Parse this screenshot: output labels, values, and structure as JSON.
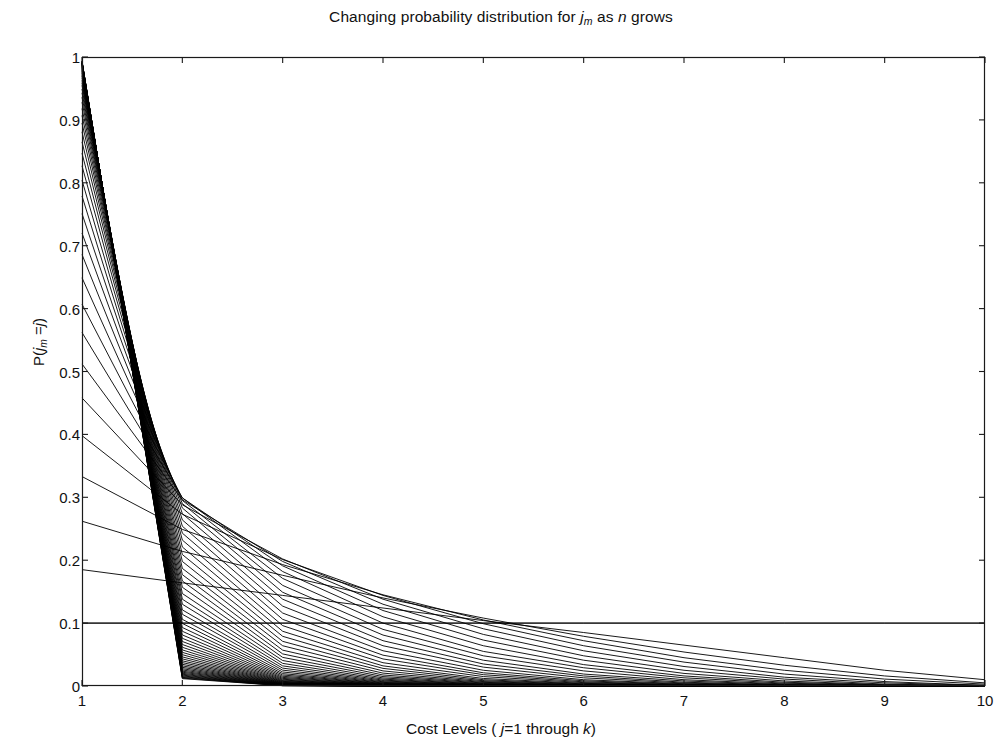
{
  "chart_data": {
    "type": "line",
    "title_parts": {
      "pre": "Changing probability distribution for ",
      "var1": "j",
      "var1_sub": "m",
      "mid": " as ",
      "var2": "n",
      "post": " grows"
    },
    "xlabel": "Cost Levels ( j=1 through  k)",
    "xlabel_parts": {
      "pre": "Cost Levels ( ",
      "var1": "j",
      "mid": "=1 through  ",
      "var2": "k",
      "post": ")"
    },
    "ylabel": "P(j_m =j)",
    "ylabel_parts": {
      "pre": "P(",
      "var1": "j",
      "var1_sub": "m",
      "mid": " =",
      "var2": "j",
      "post": ")"
    },
    "xlim": [
      1,
      10
    ],
    "ylim": [
      0,
      1
    ],
    "xticks": [
      "1",
      "2",
      "3",
      "4",
      "5",
      "6",
      "7",
      "8",
      "9",
      "10"
    ],
    "xtick_values": [
      1,
      2,
      3,
      4,
      5,
      6,
      7,
      8,
      9,
      10
    ],
    "yticks": [
      "0",
      "0.1",
      "0.2",
      "0.3",
      "0.4",
      "0.5",
      "0.6",
      "0.7",
      "0.8",
      "0.9",
      "1"
    ],
    "ytick_values": [
      0,
      0.1,
      0.2,
      0.3,
      0.4,
      0.5,
      0.6,
      0.7,
      0.8,
      0.9,
      1
    ],
    "grid": false,
    "legend": "none",
    "line_color": "#000000",
    "line_width": 0.9,
    "background_color": "#ffffff",
    "axis_color": "#1a1a1a",
    "x": [
      1,
      2,
      3,
      4,
      5,
      6,
      7,
      8,
      9,
      10
    ],
    "reference_lines": [
      {
        "orientation": "horizontal",
        "value": 0.1
      }
    ],
    "series": [
      {
        "name": "n=1",
        "values": [
          0.1,
          0.1,
          0.1,
          0.1,
          0.1,
          0.1,
          0.1,
          0.1,
          0.1,
          0.1
        ]
      },
      {
        "name": "n=2",
        "values": [
          0.185,
          0.164,
          0.144,
          0.124,
          0.104,
          0.085,
          0.065,
          0.045,
          0.025,
          0.01
        ]
      },
      {
        "name": "n=3",
        "values": [
          0.262,
          0.214,
          0.176,
          0.14,
          0.108,
          0.079,
          0.054,
          0.033,
          0.016,
          0.005
        ]
      },
      {
        "name": "n=4",
        "values": [
          0.333,
          0.249,
          0.193,
          0.145,
          0.105,
          0.072,
          0.045,
          0.025,
          0.011,
          0.003
        ]
      },
      {
        "name": "n=5",
        "values": [
          0.398,
          0.273,
          0.201,
          0.144,
          0.099,
          0.064,
          0.038,
          0.019,
          0.007,
          0.001
        ]
      },
      {
        "name": "n=6",
        "values": [
          0.458,
          0.288,
          0.202,
          0.138,
          0.091,
          0.056,
          0.031,
          0.014,
          0.005,
          0.001
        ]
      },
      {
        "name": "n=7",
        "values": [
          0.512,
          0.296,
          0.198,
          0.13,
          0.082,
          0.048,
          0.025,
          0.011,
          0.003,
          0.0005
        ]
      },
      {
        "name": "n=8",
        "values": [
          0.562,
          0.299,
          0.191,
          0.12,
          0.073,
          0.041,
          0.02,
          0.008,
          0.002,
          0.0003
        ]
      },
      {
        "name": "n=9",
        "values": [
          0.607,
          0.299,
          0.182,
          0.11,
          0.064,
          0.034,
          0.016,
          0.006,
          0.0015,
          0.0002
        ]
      },
      {
        "name": "n=10",
        "values": [
          0.649,
          0.295,
          0.171,
          0.1,
          0.055,
          0.029,
          0.013,
          0.0045,
          0.001,
          0.0001
        ]
      },
      {
        "name": "n=11",
        "values": [
          0.686,
          0.29,
          0.16,
          0.09,
          0.048,
          0.024,
          0.01,
          0.0033,
          0.0007,
          0.0001
        ]
      },
      {
        "name": "n=12",
        "values": [
          0.72,
          0.283,
          0.149,
          0.081,
          0.041,
          0.019,
          0.008,
          0.0024,
          0.0005,
          0.0001
        ]
      },
      {
        "name": "n=13",
        "values": [
          0.751,
          0.274,
          0.138,
          0.072,
          0.035,
          0.016,
          0.006,
          0.0018,
          0.0003,
          0.0
        ]
      },
      {
        "name": "n=14",
        "values": [
          0.779,
          0.264,
          0.127,
          0.064,
          0.03,
          0.013,
          0.0047,
          0.0013,
          0.0002,
          0.0
        ]
      },
      {
        "name": "n=15",
        "values": [
          0.804,
          0.254,
          0.116,
          0.056,
          0.025,
          0.01,
          0.0036,
          0.001,
          0.0002,
          0.0
        ]
      },
      {
        "name": "n=16",
        "values": [
          0.827,
          0.243,
          0.106,
          0.049,
          0.021,
          0.0082,
          0.0028,
          0.0007,
          0.0001,
          0.0
        ]
      },
      {
        "name": "n=17",
        "values": [
          0.847,
          0.232,
          0.096,
          0.043,
          0.018,
          0.0066,
          0.0021,
          0.0005,
          0.0001,
          0.0
        ]
      },
      {
        "name": "n=18",
        "values": [
          0.865,
          0.221,
          0.087,
          0.037,
          0.015,
          0.0053,
          0.0016,
          0.0004,
          0.0001,
          0.0
        ]
      },
      {
        "name": "n=19",
        "values": [
          0.881,
          0.209,
          0.079,
          0.032,
          0.012,
          0.0042,
          0.0012,
          0.0003,
          0.0,
          0.0
        ]
      },
      {
        "name": "n=20",
        "values": [
          0.895,
          0.198,
          0.071,
          0.028,
          0.01,
          0.0034,
          0.0009,
          0.0002,
          0.0,
          0.0
        ]
      },
      {
        "name": "n=21",
        "values": [
          0.907,
          0.187,
          0.064,
          0.024,
          0.0084,
          0.0027,
          0.0007,
          0.0002,
          0.0,
          0.0
        ]
      },
      {
        "name": "n=22",
        "values": [
          0.918,
          0.177,
          0.057,
          0.0205,
          0.007,
          0.0021,
          0.0006,
          0.0001,
          0.0,
          0.0
        ]
      },
      {
        "name": "n=23",
        "values": [
          0.928,
          0.167,
          0.051,
          0.0175,
          0.0058,
          0.0017,
          0.0004,
          0.0001,
          0.0,
          0.0
        ]
      },
      {
        "name": "n=24",
        "values": [
          0.936,
          0.157,
          0.0455,
          0.015,
          0.0048,
          0.0013,
          0.0003,
          0.0001,
          0.0,
          0.0
        ]
      },
      {
        "name": "n=25",
        "values": [
          0.943,
          0.147,
          0.0405,
          0.0128,
          0.0039,
          0.0011,
          0.0003,
          0.0,
          0.0,
          0.0
        ]
      },
      {
        "name": "n=26",
        "values": [
          0.949,
          0.138,
          0.036,
          0.0109,
          0.0032,
          0.0008,
          0.0002,
          0.0,
          0.0,
          0.0
        ]
      },
      {
        "name": "n=27",
        "values": [
          0.955,
          0.13,
          0.032,
          0.0093,
          0.0026,
          0.0007,
          0.0002,
          0.0,
          0.0,
          0.0
        ]
      },
      {
        "name": "n=28",
        "values": [
          0.959,
          0.121,
          0.0284,
          0.0079,
          0.0022,
          0.0005,
          0.0001,
          0.0,
          0.0,
          0.0
        ]
      },
      {
        "name": "n=29",
        "values": [
          0.963,
          0.114,
          0.0252,
          0.0067,
          0.0018,
          0.0004,
          0.0001,
          0.0,
          0.0,
          0.0
        ]
      },
      {
        "name": "n=30",
        "values": [
          0.967,
          0.106,
          0.0223,
          0.0057,
          0.0014,
          0.0003,
          0.0001,
          0.0,
          0.0,
          0.0
        ]
      },
      {
        "name": "n=31",
        "values": [
          0.97,
          0.0995,
          0.0197,
          0.0048,
          0.0012,
          0.0003,
          0.0001,
          0.0,
          0.0,
          0.0
        ]
      },
      {
        "name": "n=32",
        "values": [
          0.972,
          0.093,
          0.0175,
          0.0041,
          0.001,
          0.0002,
          0.0,
          0.0,
          0.0,
          0.0
        ]
      },
      {
        "name": "n=33",
        "values": [
          0.9745,
          0.087,
          0.0155,
          0.0035,
          0.0008,
          0.0002,
          0.0,
          0.0,
          0.0,
          0.0
        ]
      },
      {
        "name": "n=34",
        "values": [
          0.9765,
          0.0812,
          0.0137,
          0.003,
          0.0007,
          0.0001,
          0.0,
          0.0,
          0.0,
          0.0
        ]
      },
      {
        "name": "n=35",
        "values": [
          0.978,
          0.0758,
          0.0121,
          0.0025,
          0.0005,
          0.0001,
          0.0,
          0.0,
          0.0,
          0.0
        ]
      },
      {
        "name": "n=36",
        "values": [
          0.9795,
          0.0708,
          0.0107,
          0.0021,
          0.0004,
          0.0001,
          0.0,
          0.0,
          0.0,
          0.0
        ]
      },
      {
        "name": "n=37",
        "values": [
          0.981,
          0.066,
          0.0094,
          0.0018,
          0.0004,
          0.0001,
          0.0,
          0.0,
          0.0,
          0.0
        ]
      },
      {
        "name": "n=38",
        "values": [
          0.9822,
          0.0616,
          0.0083,
          0.0015,
          0.0003,
          0.0001,
          0.0,
          0.0,
          0.0,
          0.0
        ]
      },
      {
        "name": "n=39",
        "values": [
          0.9833,
          0.0574,
          0.0073,
          0.0013,
          0.0002,
          0.0,
          0.0,
          0.0,
          0.0,
          0.0
        ]
      },
      {
        "name": "n=40",
        "values": [
          0.9843,
          0.0535,
          0.0065,
          0.0011,
          0.0002,
          0.0,
          0.0,
          0.0,
          0.0,
          0.0
        ]
      },
      {
        "name": "n=41",
        "values": [
          0.9852,
          0.0498,
          0.0057,
          0.0009,
          0.0002,
          0.0,
          0.0,
          0.0,
          0.0,
          0.0
        ]
      },
      {
        "name": "n=42",
        "values": [
          0.986,
          0.0463,
          0.005,
          0.0008,
          0.0001,
          0.0,
          0.0,
          0.0,
          0.0,
          0.0
        ]
      },
      {
        "name": "n=43",
        "values": [
          0.9868,
          0.0431,
          0.0044,
          0.0007,
          0.0001,
          0.0,
          0.0,
          0.0,
          0.0,
          0.0
        ]
      },
      {
        "name": "n=44",
        "values": [
          0.9875,
          0.04,
          0.0039,
          0.0006,
          0.0001,
          0.0,
          0.0,
          0.0,
          0.0,
          0.0
        ]
      },
      {
        "name": "n=45",
        "values": [
          0.9881,
          0.0372,
          0.0034,
          0.0005,
          0.0001,
          0.0,
          0.0,
          0.0,
          0.0,
          0.0
        ]
      },
      {
        "name": "n=46",
        "values": [
          0.9887,
          0.0345,
          0.003,
          0.0004,
          0.0001,
          0.0,
          0.0,
          0.0,
          0.0,
          0.0
        ]
      },
      {
        "name": "n=47",
        "values": [
          0.9892,
          0.032,
          0.0027,
          0.0003,
          0.0,
          0.0,
          0.0,
          0.0,
          0.0,
          0.0
        ]
      },
      {
        "name": "n=48",
        "values": [
          0.9897,
          0.0297,
          0.0023,
          0.0003,
          0.0,
          0.0,
          0.0,
          0.0,
          0.0,
          0.0
        ]
      },
      {
        "name": "n=49",
        "values": [
          0.9902,
          0.0275,
          0.0021,
          0.0002,
          0.0,
          0.0,
          0.0,
          0.0,
          0.0,
          0.0
        ]
      },
      {
        "name": "n=50",
        "values": [
          0.9906,
          0.0255,
          0.0018,
          0.0002,
          0.0,
          0.0,
          0.0,
          0.0,
          0.0,
          0.0
        ]
      },
      {
        "name": "n=51",
        "values": [
          0.991,
          0.0236,
          0.0016,
          0.0002,
          0.0,
          0.0,
          0.0,
          0.0,
          0.0,
          0.0
        ]
      },
      {
        "name": "n=52",
        "values": [
          0.9914,
          0.0219,
          0.0014,
          0.0001,
          0.0,
          0.0,
          0.0,
          0.0,
          0.0,
          0.0
        ]
      },
      {
        "name": "n=53",
        "values": [
          0.9917,
          0.0202,
          0.0012,
          0.0001,
          0.0,
          0.0,
          0.0,
          0.0,
          0.0,
          0.0
        ]
      },
      {
        "name": "n=54",
        "values": [
          0.992,
          0.0187,
          0.0011,
          0.0001,
          0.0,
          0.0,
          0.0,
          0.0,
          0.0,
          0.0
        ]
      },
      {
        "name": "n=55",
        "values": [
          0.9923,
          0.0173,
          0.0009,
          0.0001,
          0.0,
          0.0,
          0.0,
          0.0,
          0.0,
          0.0
        ]
      },
      {
        "name": "n=56",
        "values": [
          0.9926,
          0.016,
          0.0008,
          0.0001,
          0.0,
          0.0,
          0.0,
          0.0,
          0.0,
          0.0
        ]
      },
      {
        "name": "n=57",
        "values": [
          0.9929,
          0.0148,
          0.0007,
          0.0001,
          0.0,
          0.0,
          0.0,
          0.0,
          0.0,
          0.0
        ]
      },
      {
        "name": "n=58",
        "values": [
          0.9931,
          0.0137,
          0.0006,
          0.0,
          0.0,
          0.0,
          0.0,
          0.0,
          0.0,
          0.0
        ]
      },
      {
        "name": "n=59",
        "values": [
          0.9933,
          0.0126,
          0.0006,
          0.0,
          0.0,
          0.0,
          0.0,
          0.0,
          0.0,
          0.0
        ]
      },
      {
        "name": "n=60",
        "values": [
          0.9936,
          0.0117,
          0.0005,
          0.0,
          0.0,
          0.0,
          0.0,
          0.0,
          0.0,
          0.0
        ]
      }
    ]
  },
  "plot_geometry": {
    "left": 82,
    "top": 57,
    "right": 985,
    "bottom": 686
  }
}
